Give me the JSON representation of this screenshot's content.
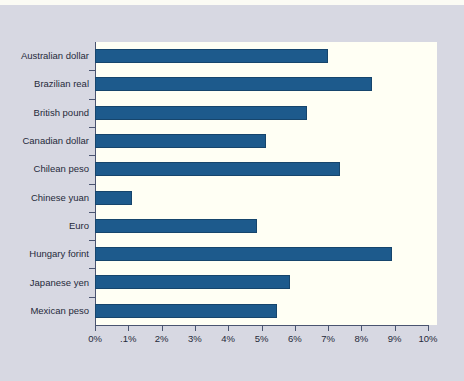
{
  "chart_data": {
    "type": "bar",
    "orientation": "horizontal",
    "title": "",
    "subtitle": "",
    "xlabel": "",
    "ylabel": "",
    "xlim": [
      0,
      10
    ],
    "ylim": null,
    "grid": false,
    "legend": null,
    "legend_position": "none",
    "categories": [
      "Australian dollar",
      "Brazilian real",
      "British pound",
      "Canadian dollar",
      "Chilean peso",
      "Chinese yuan",
      "Euro",
      "Hungary forint",
      "Japanese yen",
      "Mexican peso"
    ],
    "values": [
      6.99,
      8.31,
      6.36,
      5.13,
      7.35,
      1.11,
      4.86,
      8.91,
      5.85,
      5.46
    ],
    "value_unit": "%",
    "xticks": [
      0,
      1,
      2,
      3,
      4,
      5,
      6,
      7,
      8,
      9,
      10
    ],
    "xticklabels": [
      "0%",
      ".1%",
      "2%",
      "3%",
      "4%",
      "5%",
      "6%",
      "7%",
      "8%",
      "9%",
      "10%"
    ],
    "series": [
      {
        "name": "",
        "values": [
          6.99,
          8.31,
          6.36,
          5.13,
          7.35,
          1.11,
          4.86,
          8.91,
          5.85,
          5.46
        ]
      }
    ],
    "colors": {
      "bar_fill": "#1d5a8c",
      "bar_border": "#16456c",
      "plot_background": "#fffff4",
      "figure_background": "#d7d8e2",
      "axis": "#4a5470",
      "text": "#262a3a"
    }
  }
}
